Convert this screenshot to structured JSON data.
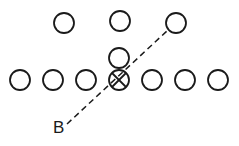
{
  "diagram": {
    "label": "B",
    "label_pos": {
      "x": 53,
      "y": 133
    },
    "stroke_color": "#1a1a1a",
    "background": "#ffffff",
    "circle_radius": 10,
    "top_row": [
      {
        "x": 64,
        "y": 23
      },
      {
        "x": 120,
        "y": 21
      },
      {
        "x": 176,
        "y": 23
      }
    ],
    "middle": [
      {
        "x": 119,
        "y": 58
      }
    ],
    "bottom_row": [
      {
        "x": 20,
        "y": 80
      },
      {
        "x": 53,
        "y": 80
      },
      {
        "x": 86,
        "y": 80
      },
      {
        "x": 119,
        "y": 80,
        "crossed": true
      },
      {
        "x": 152,
        "y": 80
      },
      {
        "x": 185,
        "y": 80
      },
      {
        "x": 218,
        "y": 80
      }
    ],
    "dashed_line": {
      "x1": 67,
      "y1": 124,
      "x2": 168,
      "y2": 30
    }
  }
}
